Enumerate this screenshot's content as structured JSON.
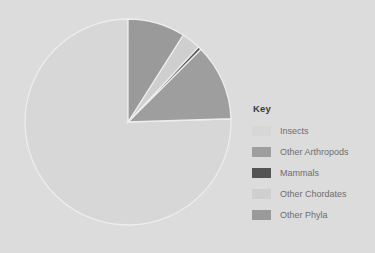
{
  "background_color": "#dcdcdc",
  "legend": {
    "title": "Key",
    "position": "right",
    "title_color": "#3b3b3b",
    "label_color": "#6e6e6e"
  },
  "chart_data": {
    "type": "pie",
    "title": "",
    "subtitle": "",
    "xlabel": "",
    "ylabel": "",
    "grid": false,
    "legend_position": "right",
    "start_angle_deg": 90,
    "direction": "counterclockwise",
    "categories": [
      "Insects",
      "Other Arthropods",
      "Mammals",
      "Other Chordates",
      "Other Phyla"
    ],
    "values": [
      75.5,
      12.0,
      0.5,
      3.0,
      9.0
    ],
    "unit": "%",
    "colors": [
      "#d7d7d7",
      "#9e9e9e",
      "#545454",
      "#cfcfcf",
      "#9a9a9a"
    ],
    "slice_separator_color": "#ededed",
    "slices": [
      {
        "label": "Insects",
        "value": 75.5,
        "color": "#d7d7d7"
      },
      {
        "label": "Other Arthropods",
        "value": 12.0,
        "color": "#9e9e9e"
      },
      {
        "label": "Mammals",
        "value": 0.5,
        "color": "#545454"
      },
      {
        "label": "Other Chordates",
        "value": 3.0,
        "color": "#cfcfcf"
      },
      {
        "label": "Other Phyla",
        "value": 9.0,
        "color": "#9a9a9a"
      }
    ]
  }
}
